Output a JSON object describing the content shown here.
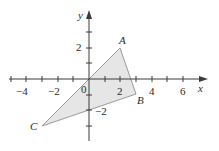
{
  "diagram": {
    "type": "coordinate-plane-triangle",
    "axes": {
      "x_label": "x",
      "y_label": "y",
      "origin_label": "0",
      "x_tick_labels": [
        {
          "value": -4,
          "text": "−4"
        },
        {
          "value": -2,
          "text": "−2"
        },
        {
          "value": 2,
          "text": "2"
        },
        {
          "value": 4,
          "text": "4"
        },
        {
          "value": 6,
          "text": "6"
        }
      ],
      "y_tick_labels": [
        {
          "value": 2,
          "text": "2"
        },
        {
          "value": -2,
          "text": "−2"
        }
      ],
      "x_range": [
        -5,
        7
      ],
      "y_range": [
        -4,
        4
      ]
    },
    "points": [
      {
        "name": "A",
        "x": 2,
        "y": 2
      },
      {
        "name": "B",
        "x": 3,
        "y": -1
      },
      {
        "name": "C",
        "x": -3,
        "y": -3
      }
    ],
    "fill_color": "#e3e3e3",
    "edge_color": "#9a9a9a",
    "axis_color": "#3a3a3a"
  }
}
